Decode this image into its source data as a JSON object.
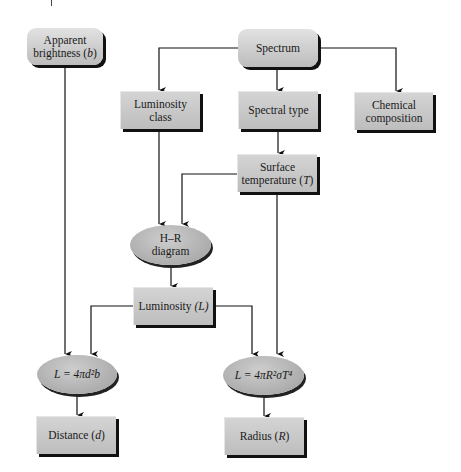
{
  "diagram": {
    "nodes": {
      "apparent_brightness": {
        "line1": "Apparent",
        "line2": "brightness (",
        "var": "b",
        "close": ")"
      },
      "spectrum": {
        "label": "Spectrum"
      },
      "luminosity_class": {
        "line1": "Luminosity",
        "line2": "class"
      },
      "spectral_type": {
        "label": "Spectral type"
      },
      "chemical_composition": {
        "line1": "Chemical",
        "line2": "composition"
      },
      "surface_temperature": {
        "line1": "Surface",
        "line2": "temperature (",
        "var": "T",
        "close": ")"
      },
      "hr_diagram": {
        "line1": "H–R",
        "line2": "diagram"
      },
      "luminosity": {
        "label": "Luminosity ",
        "var": "(L)"
      },
      "distance_equation": {
        "label": "L = 4πd²b"
      },
      "radius_equation": {
        "label": "L = 4πR²σT⁴"
      },
      "distance": {
        "label": "Distance (",
        "var": "d",
        "close": ")"
      },
      "radius": {
        "label": "Radius (",
        "var": "R",
        "close": ")"
      }
    },
    "edges": [
      [
        "Spectrum",
        "Luminosity class"
      ],
      [
        "Spectrum",
        "Spectral type"
      ],
      [
        "Spectrum",
        "Chemical composition"
      ],
      [
        "Spectral type",
        "Surface temperature (T)"
      ],
      [
        "Luminosity class",
        "H–R diagram"
      ],
      [
        "Surface temperature (T)",
        "H–R diagram"
      ],
      [
        "H–R diagram",
        "Luminosity (L)"
      ],
      [
        "Apparent brightness (b)",
        "L = 4πd²b"
      ],
      [
        "Luminosity (L)",
        "L = 4πd²b"
      ],
      [
        "Luminosity (L)",
        "L = 4πR²σT⁴"
      ],
      [
        "Surface temperature (T)",
        "L = 4πR²σT⁴"
      ],
      [
        "L = 4πd²b",
        "Distance (d)"
      ],
      [
        "L = 4πR²σT⁴",
        "Radius (R)"
      ]
    ],
    "colors": {
      "box_fill": "#c8c8c8",
      "ellipse_fill": "#a8a8a8",
      "line": "#111111",
      "shadow": "#111111"
    }
  }
}
